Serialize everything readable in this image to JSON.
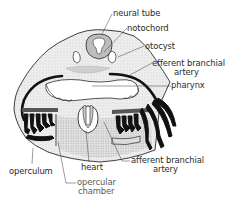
{
  "figure": {
    "type": "anatomical cross-section diagram",
    "labels": {
      "neural_tube": "neural tube",
      "notochord": "notochord",
      "otocyst": "otocyst",
      "efferent_branchial_artery_1": "efferent branchial",
      "efferent_branchial_artery_2": "artery",
      "pharynx": "pharynx",
      "afferent_branchial_artery_1": "afferent branchial",
      "afferent_branchial_artery_2": "artery",
      "heart": "heart",
      "operculum": "operculum",
      "opercular_chamber_1": "opercular",
      "opercular_chamber_2": "chamber"
    },
    "colors": {
      "ink": "#1a1a1a",
      "tissue_fill": "#ececec",
      "stipple": "#b8b8b8",
      "background": "#ffffff"
    }
  }
}
